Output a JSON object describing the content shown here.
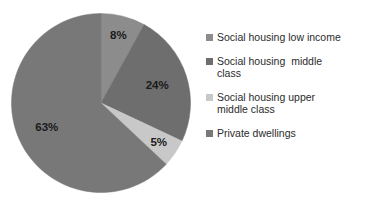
{
  "chart_data": {
    "type": "pie",
    "title": "Housing stock by tenure",
    "title_visible": false,
    "categories": [
      "Social housing low income",
      "Social housing  middle class",
      "Social housing upper middle class",
      "Private dwellings"
    ],
    "values": [
      8,
      24,
      5,
      63
    ],
    "value_labels": [
      "8%",
      "24%",
      "5%",
      "63%"
    ],
    "unit": "%",
    "colors": [
      "#8c8c8c",
      "#6e6e6e",
      "#c8c8c8",
      "#787878"
    ],
    "start_angle_deg": 0,
    "direction": "clockwise",
    "legend_position": "right",
    "grid": false,
    "xlabel": "",
    "ylabel": "",
    "slices": [
      {
        "label": "Social housing low income",
        "value": 8,
        "display": "8%",
        "color": "#8c8c8c"
      },
      {
        "label": "Social housing  middle class",
        "value": 24,
        "display": "24%",
        "color": "#6e6e6e"
      },
      {
        "label": "Social housing upper middle class",
        "value": 5,
        "display": "5%",
        "color": "#c8c8c8"
      },
      {
        "label": "Private dwellings",
        "value": 63,
        "display": "63%",
        "color": "#787878"
      }
    ]
  },
  "legend": {
    "items": [
      {
        "label": "Social housing low income"
      },
      {
        "label": "Social housing  middle\nclass"
      },
      {
        "label": "Social housing upper\nmiddle class"
      },
      {
        "label": "Private dwellings"
      }
    ]
  }
}
